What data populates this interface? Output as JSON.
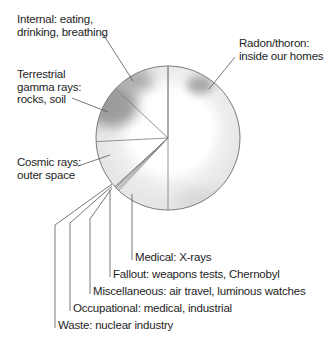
{
  "chart_data": {
    "type": "pie",
    "title": "",
    "start_angle_deg": -90,
    "direction": "clockwise",
    "slices": [
      {
        "key": "radon",
        "label": "Radon/thoron: inside our homes",
        "lines": [
          "Radon/thoron:",
          "inside our homes"
        ],
        "value": 50.0
      },
      {
        "key": "medical",
        "label": "Medical: X-rays",
        "lines": [
          "Medical: X-rays"
        ],
        "value": 12.0
      },
      {
        "key": "fallout",
        "label": "Fallout: weapons tests, Chernobyl",
        "lines": [
          "Fallout: weapons tests, Chernobyl"
        ],
        "value": 0.4
      },
      {
        "key": "misc",
        "label": "Miscellaneous: air travel, luminous watches",
        "lines": [
          "Miscellaneous: air travel, luminous watches"
        ],
        "value": 0.4
      },
      {
        "key": "occupational",
        "label": "Occupational: medical, industrial",
        "lines": [
          "Occupational: medical, industrial"
        ],
        "value": 0.3
      },
      {
        "key": "waste",
        "label": "Waste: nuclear industry",
        "lines": [
          "Waste: nuclear industry"
        ],
        "value": 0.1
      },
      {
        "key": "cosmic",
        "label": "Cosmic rays: outer space",
        "lines": [
          "Cosmic rays:",
          "outer space"
        ],
        "value": 11.0
      },
      {
        "key": "terrestrial",
        "label": "Terrestrial gamma rays: rocks, soil",
        "lines": [
          "Terrestrial",
          "gamma rays:",
          "rocks, soil"
        ],
        "value": 12.8
      },
      {
        "key": "internal",
        "label": "Internal: eating, drinking, breathing",
        "lines": [
          "Internal: eating,",
          "drinking, breathing"
        ],
        "value": 13.0
      }
    ],
    "legend": "none (callout labels with leader lines)"
  },
  "colors": {
    "pie_fill": "#ececec",
    "pie_center_highlight": "#ffffff",
    "shade_dark": "#8c8c8c",
    "outline": "#7a7a7a",
    "leader_line": "#555555",
    "text": "#1e1e1e"
  },
  "labels": {
    "internal": [
      "Internal: eating,",
      "drinking, breathing"
    ],
    "terrestrial": [
      "Terrestrial",
      "gamma rays:",
      "rocks, soil"
    ],
    "cosmic": [
      "Cosmic rays:",
      "outer space"
    ],
    "radon": [
      "Radon/thoron:",
      "inside our homes"
    ],
    "medical": "Medical: X-rays",
    "fallout": "Fallout: weapons tests, Chernobyl",
    "misc": "Miscellaneous: air travel, luminous watches",
    "occupational": "Occupational: medical, industrial",
    "waste": "Waste: nuclear industry"
  }
}
